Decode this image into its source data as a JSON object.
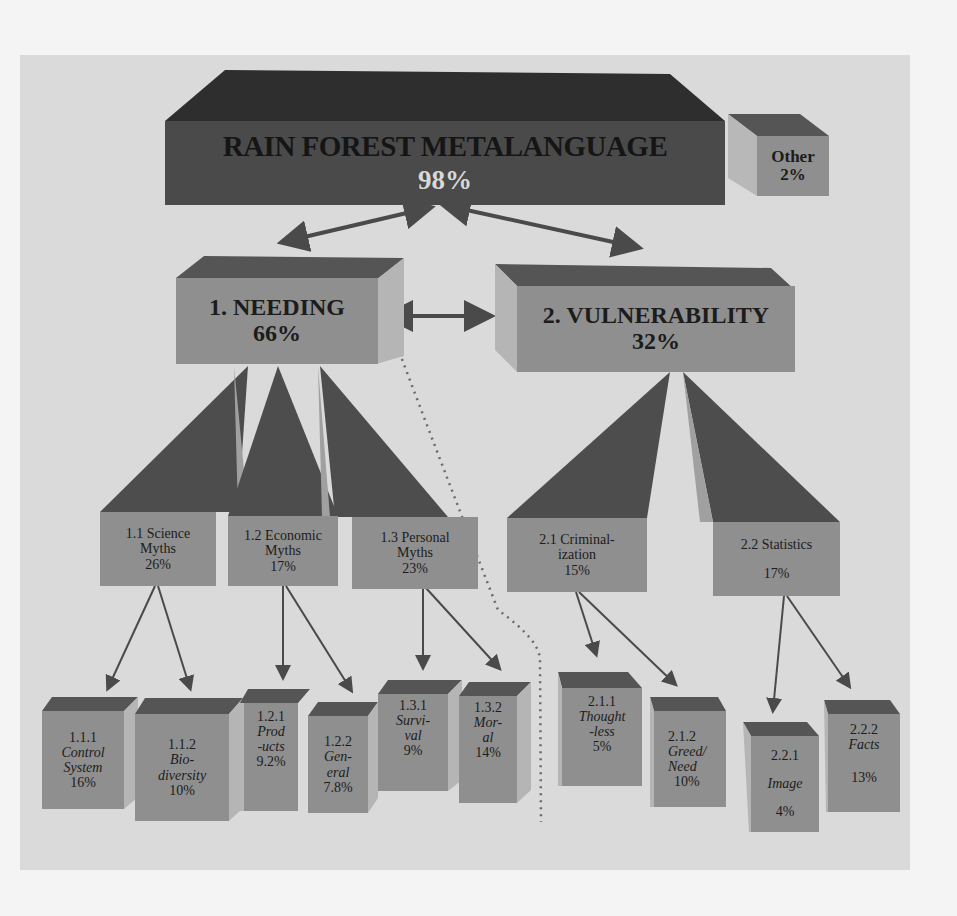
{
  "diagram": {
    "root": {
      "number": "1",
      "title": "RAIN FOREST METALANGUAGE",
      "percent": "98%"
    },
    "other": {
      "title": "Other",
      "percent": "2%"
    },
    "level1": [
      {
        "id": "1",
        "title": "1. NEEDING",
        "percent": "66%"
      },
      {
        "id": "2",
        "title": "2. VULNERABILITY",
        "percent": "32%"
      }
    ],
    "level2": [
      {
        "id": "1.1",
        "line1": "1.1  Science",
        "line2": "Myths",
        "percent": "26%"
      },
      {
        "id": "1.2",
        "line1": "1.2 Economic",
        "line2": "Myths",
        "percent": "17%"
      },
      {
        "id": "1.3",
        "line1": "1.3 Personal",
        "line2": "Myths",
        "percent": "23%"
      },
      {
        "id": "2.1",
        "line1": "2.1 Criminal-",
        "line2": "ization",
        "percent": "15%"
      },
      {
        "id": "2.2",
        "line1": "2.2 Statistics",
        "line2": "",
        "percent": "17%"
      }
    ],
    "level3": [
      {
        "id": "1.1.1",
        "l1": "Control",
        "l2": "System",
        "percent": "16%"
      },
      {
        "id": "1.1.2",
        "l1": "Bio-",
        "l2": "diversity",
        "percent": "10%"
      },
      {
        "id": "1.2.1",
        "l1": "Prod",
        "l2": "-ucts",
        "percent": "9.2%"
      },
      {
        "id": "1.2.2",
        "l1": "Gen-",
        "l2": "eral",
        "percent": "7.8%"
      },
      {
        "id": "1.3.1",
        "l1": "Survi-",
        "l2": "val",
        "percent": "9%"
      },
      {
        "id": "1.3.2",
        "l1": "Mor-",
        "l2": "al",
        "percent": "14%"
      },
      {
        "id": "2.1.1",
        "l1": "Thought",
        "l2": "-less",
        "percent": "5%"
      },
      {
        "id": "2.1.2",
        "l1": "Greed/",
        "l2": "Need",
        "percent": "10%"
      },
      {
        "id": "2.2.1",
        "l1": "Image",
        "l2": "",
        "percent": "4%"
      },
      {
        "id": "2.2.2",
        "l1": "Facts",
        "l2": "",
        "percent": "13%"
      }
    ]
  },
  "colors": {
    "background": "#f4f4f4",
    "panel": "#dadada",
    "root_front": "#4a4a4a",
    "root_top": "#2e2e2e",
    "box_front": "#8f8f8f",
    "box_top": "#555555",
    "box_side": "#b5b5b5",
    "wedge": "#4d4d4d",
    "arrow": "#4a4a4a",
    "percent_light": "#d8d8d8"
  }
}
